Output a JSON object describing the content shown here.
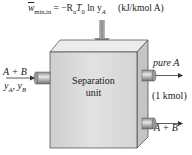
{
  "equation": {
    "lhs": "w",
    "lhs_sub": "min,in",
    "rhs_prefix": "= −R",
    "Ru_sub": "u",
    "T": "T",
    "T_sub": "0",
    "ln": " ln y",
    "y_sub": "A",
    "units": "(kJ/kmol A)"
  },
  "unit": {
    "line1": "Separation",
    "line2": "unit"
  },
  "inlet": {
    "mixture": "A + B",
    "fractions": "y_A, y_B"
  },
  "outlets": {
    "top": "pure A",
    "amount": "(1 kmol)",
    "bottom": "A + B"
  },
  "colors": {
    "box_front": "#d9d9d9",
    "box_top": "#ececec",
    "box_side": "#bdbdbd",
    "arrow": "#9a9a9a"
  }
}
